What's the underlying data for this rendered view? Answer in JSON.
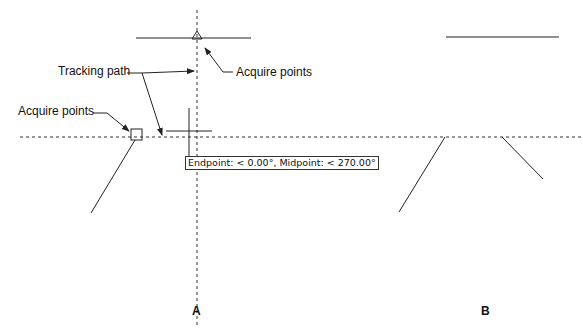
{
  "figure": {
    "panels": [
      {
        "id": "A",
        "label": "A"
      },
      {
        "id": "B",
        "label": "B"
      }
    ],
    "callouts": {
      "tracking_path": "Tracking path",
      "acquire_points_top": "Acquire points",
      "acquire_points_left": "Acquire points"
    },
    "tooltip": "Endpoint: < 0.00°, Midpoint: < 270.00°",
    "markers": {
      "midpoint_marker": "triangle",
      "endpoint_marker": "square"
    },
    "colors": {
      "line": "#222222",
      "background": "#ffffff"
    }
  }
}
